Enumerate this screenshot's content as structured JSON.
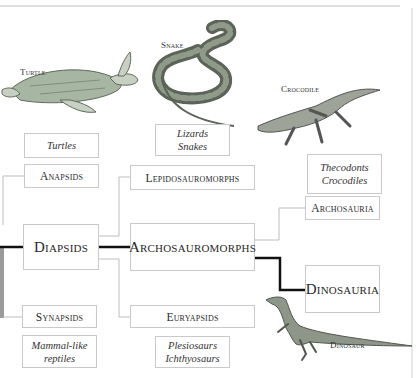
{
  "diagram": {
    "colors": {
      "thin_line": "#bdbdbd",
      "thick_line": "#111111",
      "box_border": "#c9c9c9",
      "gray_bar": "#9a9a9a"
    },
    "animal_labels": {
      "turtle": "Turtle",
      "snake": "Snake",
      "crocodile": "Crocodile",
      "dinosaur": "Dinosaur"
    },
    "groups": {
      "anapsids": "Anapsids",
      "diapsids": "Diapsids",
      "synapsids": "Synapsids",
      "lepidosauromorphs": "Lepidosauromorphs",
      "archosauromorphs": "Archosauromorphs",
      "euryapsids": "Euryapsids",
      "archosauria": "Archosauria",
      "dinosauria": "Dinosauria"
    },
    "examples": {
      "turtles": [
        "Turtles"
      ],
      "lizards_snakes": [
        "Lizards",
        "Snakes"
      ],
      "thecodonts_crocodiles": [
        "Thecodonts",
        "Crocodiles"
      ],
      "mammal_like": [
        "Mammal-like",
        "reptiles"
      ],
      "plesiosaurs": [
        "Plesiosaurs",
        "Ichthyosaurs"
      ]
    }
  }
}
